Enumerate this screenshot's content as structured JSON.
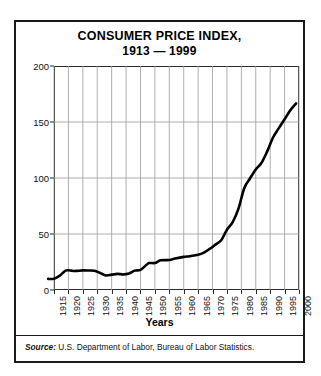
{
  "figure": {
    "title_line1": "CONSUMER PRICE INDEX,",
    "title_line2": "1913 — 1999",
    "source_label": "Source:",
    "source_text": " U.S. Department of Labor, Bureau of Labor Statistics."
  },
  "chart_data": {
    "type": "line",
    "title": "CONSUMER PRICE INDEX, 1913 — 1999",
    "xlabel": "Years",
    "ylabel": "",
    "xlim": [
      1913,
      1999
    ],
    "ylim": [
      0,
      200
    ],
    "yticks": [
      0,
      50,
      100,
      150,
      200
    ],
    "xticks": [
      1915,
      1920,
      1925,
      1930,
      1935,
      1940,
      1945,
      1950,
      1955,
      1960,
      1965,
      1970,
      1975,
      1980,
      1985,
      1990,
      1995,
      2000
    ],
    "grid": "vertical-and-horizontal",
    "legend": "none",
    "line_color": "#000000",
    "series": [
      {
        "name": "Consumer Price Index",
        "x": [
          1913,
          1915,
          1917,
          1918,
          1919,
          1920,
          1921,
          1922,
          1923,
          1925,
          1927,
          1929,
          1931,
          1933,
          1935,
          1937,
          1939,
          1941,
          1943,
          1945,
          1947,
          1948,
          1950,
          1952,
          1955,
          1957,
          1960,
          1962,
          1965,
          1967,
          1969,
          1971,
          1973,
          1975,
          1977,
          1979,
          1981,
          1983,
          1985,
          1987,
          1989,
          1991,
          1993,
          1995,
          1997,
          1999
        ],
        "values": [
          9.9,
          10.1,
          12.8,
          15.1,
          17.3,
          17.6,
          17.3,
          17.0,
          17.1,
          17.5,
          17.4,
          17.1,
          15.2,
          13.0,
          13.7,
          14.4,
          13.9,
          14.7,
          17.3,
          18.0,
          22.3,
          24.1,
          24.1,
          26.5,
          26.8,
          28.1,
          29.6,
          30.2,
          31.5,
          33.4,
          36.7,
          40.5,
          44.4,
          53.8,
          60.6,
          72.6,
          90.9,
          99.6,
          107.6,
          113.6,
          124.0,
          136.2,
          144.5,
          152.4,
          160.5,
          166.6
        ]
      }
    ],
    "annotations": []
  },
  "axis": {
    "x_title": "Years"
  }
}
